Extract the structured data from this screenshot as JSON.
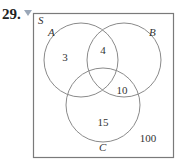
{
  "problem": {
    "number": "29."
  },
  "diagram": {
    "universal_label": "S",
    "sets": [
      {
        "name": "A",
        "cx": 81,
        "cy": 60,
        "r": 37
      },
      {
        "name": "B",
        "cx": 124,
        "cy": 60,
        "r": 37
      },
      {
        "name": "C",
        "cx": 103,
        "cy": 105,
        "r": 37
      }
    ],
    "regions": {
      "A_only": "3",
      "A_and_B": "4",
      "B_and_C": "10",
      "C_only": "15",
      "outside": "100"
    },
    "colors": {
      "stroke": "#8a8a8a",
      "border": "#7a7a7a",
      "bookmark": "#9aa7b8"
    }
  }
}
